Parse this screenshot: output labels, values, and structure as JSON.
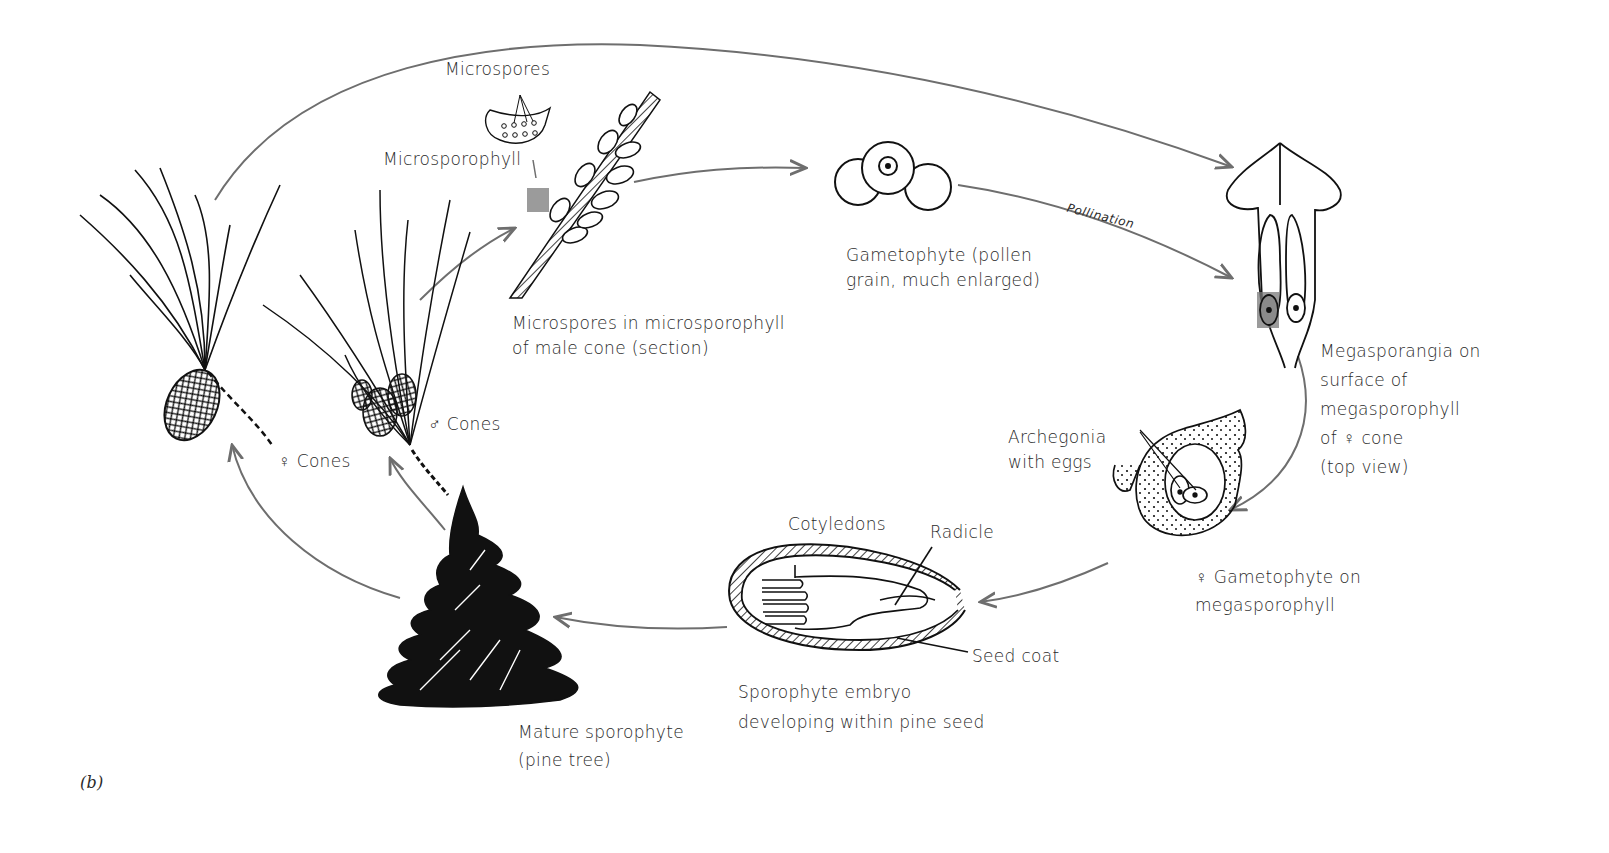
{
  "figure": {
    "panel_label": "(b)"
  },
  "stages": {
    "mature_sporophyte": {
      "lines": [
        "Mature sporophyte",
        "(pine tree)"
      ]
    },
    "female_cones": {
      "label": "♀ Cones"
    },
    "male_cones": {
      "label": "♂ Cones"
    },
    "microspores_section": {
      "lines": [
        "Microspores in microsporophyll",
        "of male cone (section)"
      ]
    },
    "microspores_callout": {
      "label": "Microspores"
    },
    "microsporophyll_callout": {
      "label": "Microsporophyll"
    },
    "pollen_gametophyte": {
      "lines": [
        "Gametophyte (pollen",
        "grain, much enlarged)"
      ]
    },
    "pollination": {
      "label": "Pollination"
    },
    "megasporangia": {
      "lines": [
        "Megasporangia on",
        "surface of",
        "megasporophyll",
        "of ♀ cone",
        "(top view)"
      ]
    },
    "archegonia": {
      "lines": [
        "Archegonia",
        "with eggs"
      ]
    },
    "female_gametophyte": {
      "lines": [
        "♀ Gametophyte on",
        "megasporophyll"
      ]
    },
    "embryo": {
      "lines": [
        "Sporophyte embryo",
        "developing within pine seed"
      ]
    },
    "cotyledons": {
      "label": "Cotyledons"
    },
    "radicle": {
      "label": "Radicle"
    },
    "seed_coat": {
      "label": "Seed coat"
    }
  },
  "colors": {
    "arrow": "#6e6e6e",
    "ink": "#111111",
    "highlight_box": "#7a7a7a",
    "background": "#ffffff"
  }
}
